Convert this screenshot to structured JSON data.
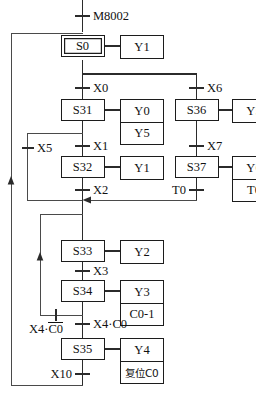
{
  "diagram": {
    "type": "sequential-function-chart",
    "title_visible": false,
    "width": 256,
    "height": 396,
    "colors": {
      "line": "#2b2b2b",
      "box_border": "#1c1c1c",
      "text": "#111111",
      "background": "#ffffff"
    }
  },
  "steps": [
    {
      "id": "s0",
      "label": "S0",
      "initial": true
    },
    {
      "id": "s31",
      "label": "S31",
      "initial": false
    },
    {
      "id": "s32",
      "label": "S32",
      "initial": false
    },
    {
      "id": "s33",
      "label": "S33",
      "initial": false
    },
    {
      "id": "s34",
      "label": "S34",
      "initial": false
    },
    {
      "id": "s35",
      "label": "S35",
      "initial": false
    },
    {
      "id": "s36",
      "label": "S36",
      "initial": false
    },
    {
      "id": "s37",
      "label": "S37",
      "initial": false
    }
  ],
  "actions": {
    "s0": {
      "lines": [
        "Y1"
      ]
    },
    "s31": {
      "lines": [
        "Y0",
        "Y5"
      ]
    },
    "s32": {
      "lines": [
        "Y1"
      ]
    },
    "s33": {
      "lines": [
        "Y2"
      ]
    },
    "s34": {
      "lines": [
        "Y3",
        "C0-1"
      ]
    },
    "s35": {
      "lines": [
        "Y4",
        "复位C0"
      ]
    },
    "s36": {
      "lines": [
        "Y5"
      ]
    },
    "s37": {
      "lines": [
        "Y6",
        "T0"
      ]
    }
  },
  "transitions": [
    {
      "id": "t_m8002",
      "label": "M8002",
      "side": "right"
    },
    {
      "id": "t_x0",
      "label": "X0",
      "side": "right"
    },
    {
      "id": "t_x6",
      "label": "X6",
      "side": "right"
    },
    {
      "id": "t_x1",
      "label": "X1",
      "side": "right"
    },
    {
      "id": "t_x7",
      "label": "X7",
      "side": "right"
    },
    {
      "id": "t_x5",
      "label": "X5",
      "side": "right"
    },
    {
      "id": "t_x2",
      "label": "X2",
      "side": "right"
    },
    {
      "id": "t_t0",
      "label": "T0",
      "side": "left"
    },
    {
      "id": "t_x3",
      "label": "X3",
      "side": "right"
    },
    {
      "id": "t_x4c0b",
      "label_prefix": "X4·",
      "label_overline": "C0",
      "side": "left"
    },
    {
      "id": "t_x4c0",
      "label": "X4·C0",
      "side": "right"
    },
    {
      "id": "t_x10",
      "label": "X10",
      "side": "left"
    }
  ]
}
